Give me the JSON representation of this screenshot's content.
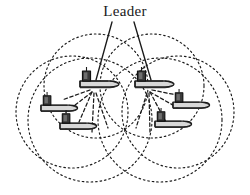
{
  "figure": {
    "background_color": "#ffffff",
    "stroke_color": "#1a1a1a",
    "width": 250,
    "height": 195
  },
  "annotations": [
    {
      "id": "leader-label",
      "text": "Leader",
      "x": 125,
      "y": 16,
      "anchor": "middle",
      "font_size": 15
    }
  ],
  "leader_lines": [
    {
      "id": "leader-pointer-left",
      "x1": 112,
      "y1": 22,
      "x2": 96,
      "y2": 80
    },
    {
      "id": "leader-pointer-right",
      "x1": 134,
      "y1": 22,
      "x2": 151,
      "y2": 80
    }
  ],
  "range_circles": [
    {
      "id": "range-circle-1",
      "cx": 96,
      "cy": 86,
      "r": 52
    },
    {
      "id": "range-circle-2",
      "cx": 152,
      "cy": 86,
      "r": 52
    },
    {
      "id": "range-circle-3",
      "cx": 72,
      "cy": 112,
      "r": 56
    },
    {
      "id": "range-circle-4",
      "cx": 178,
      "cy": 112,
      "r": 56
    },
    {
      "id": "range-circle-5",
      "cx": 90,
      "cy": 120,
      "r": 62
    },
    {
      "id": "range-circle-6",
      "cx": 160,
      "cy": 120,
      "r": 62
    }
  ],
  "vessels": [
    {
      "id": "vessel-leader-left",
      "role": "leader",
      "x": 96,
      "y": 84,
      "scale": 1.0,
      "flip": false
    },
    {
      "id": "vessel-leader-right",
      "role": "leader",
      "x": 151,
      "y": 84,
      "scale": 1.0,
      "flip": false
    },
    {
      "id": "vessel-follower-left-upper",
      "role": "follower",
      "x": 56,
      "y": 108,
      "scale": 0.94,
      "flip": false
    },
    {
      "id": "vessel-follower-left-lower",
      "role": "follower",
      "x": 75,
      "y": 126,
      "scale": 0.94,
      "flip": false
    },
    {
      "id": "vessel-follower-right-upper",
      "role": "follower",
      "x": 188,
      "y": 105,
      "scale": 0.94,
      "flip": false
    },
    {
      "id": "vessel-follower-right-lower",
      "role": "follower",
      "x": 170,
      "y": 124,
      "scale": 0.94,
      "flip": false
    }
  ],
  "communication_links": [
    {
      "id": "link-left-a",
      "x1": 92,
      "y1": 92,
      "x2": 66,
      "y2": 112
    },
    {
      "id": "link-left-b",
      "x1": 92,
      "y1": 92,
      "x2": 79,
      "y2": 122
    },
    {
      "id": "link-left-c",
      "x1": 94,
      "y1": 93,
      "x2": 92,
      "y2": 132
    },
    {
      "id": "link-left-d",
      "x1": 96,
      "y1": 93,
      "x2": 108,
      "y2": 128
    },
    {
      "id": "link-left-e",
      "x1": 90,
      "y1": 90,
      "x2": 62,
      "y2": 100
    },
    {
      "id": "link-right-a",
      "x1": 150,
      "y1": 92,
      "x2": 178,
      "y2": 108
    },
    {
      "id": "link-right-b",
      "x1": 150,
      "y1": 92,
      "x2": 166,
      "y2": 122
    },
    {
      "id": "link-right-c",
      "x1": 149,
      "y1": 93,
      "x2": 150,
      "y2": 132
    },
    {
      "id": "link-right-d",
      "x1": 147,
      "y1": 93,
      "x2": 136,
      "y2": 128
    },
    {
      "id": "link-right-e",
      "x1": 152,
      "y1": 90,
      "x2": 182,
      "y2": 96
    }
  ]
}
